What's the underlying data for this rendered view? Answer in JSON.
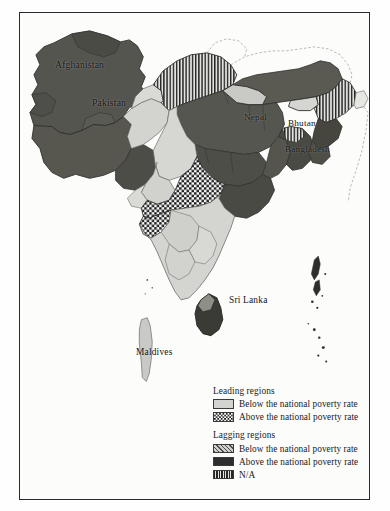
{
  "figure": {
    "kind": "choropleth-map",
    "region": "South Asia"
  },
  "map": {
    "labels": [
      {
        "key": "afghanistan",
        "text": "Afghanistan"
      },
      {
        "key": "pakistan",
        "text": "Pakistan"
      },
      {
        "key": "nepal",
        "text": "Nepal"
      },
      {
        "key": "bhutan",
        "text": "Bhutan"
      },
      {
        "key": "bangladesh",
        "text": "Bangladesh"
      },
      {
        "key": "srilanka",
        "text": "Sri Lanka"
      },
      {
        "key": "maldives",
        "text": "Maldives"
      }
    ]
  },
  "legend": {
    "groups": [
      {
        "title": "Leading regions",
        "items": [
          {
            "pattern": "solid-light-gray",
            "label": "Below the national poverty rate",
            "color": "#d3d3d0"
          },
          {
            "pattern": "checkerboard",
            "label": "Above the national poverty rate",
            "color": "#1b1b1b"
          }
        ]
      },
      {
        "title": "Lagging regions",
        "items": [
          {
            "pattern": "diagonal-hatch",
            "label": "Below the national poverty rate",
            "color": "#4d4d4d"
          },
          {
            "pattern": "solid-dark",
            "label": "Above the national poverty rate",
            "color": "#2e2e2e"
          },
          {
            "pattern": "vertical-hatch",
            "label": "N/A",
            "color": "#262626"
          }
        ]
      }
    ]
  },
  "colors": {
    "frame": "#2a2a2a",
    "background": "#fefefe",
    "sea": "#fcfcfb",
    "light_gray": "#d3d3d0",
    "dark_gray": "#555552",
    "darker_gray": "#3c3c39",
    "border_line": "#6b6b66"
  }
}
